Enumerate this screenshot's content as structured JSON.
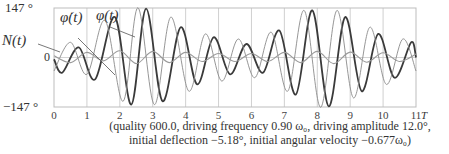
{
  "chart_data": {
    "type": "line",
    "title": "",
    "xlabel": "T",
    "ylabel": "",
    "xlim": [
      0,
      11
    ],
    "ylim": [
      -147,
      147
    ],
    "grid": {
      "vertical": true,
      "horizontal": false
    },
    "x_ticks": [
      "0",
      "1",
      "2",
      "3",
      "4",
      "5",
      "6",
      "7",
      "8",
      "9",
      "10",
      "11"
    ],
    "x_unit_label": "T",
    "y_ticks": [
      "147 °",
      "0",
      "−147 °"
    ],
    "legend": "inline labels",
    "series": [
      {
        "name": "φ(t)",
        "label": "φ(t)",
        "style": "thick dark",
        "color": "#3a3a3a",
        "points": [
          [
            0,
            -5
          ],
          [
            0.25,
            -45
          ],
          [
            0.75,
            30
          ],
          [
            1.25,
            -65
          ],
          [
            1.85,
            120
          ],
          [
            2.35,
            -140
          ],
          [
            2.8,
            145
          ],
          [
            3.3,
            -130
          ],
          [
            3.85,
            90
          ],
          [
            4.35,
            -80
          ],
          [
            4.85,
            60
          ],
          [
            5.35,
            -50
          ],
          [
            5.85,
            40
          ],
          [
            6.35,
            -45
          ],
          [
            6.85,
            80
          ],
          [
            7.35,
            -110
          ],
          [
            7.85,
            140
          ],
          [
            8.35,
            -145
          ],
          [
            8.85,
            120
          ],
          [
            9.35,
            -100
          ],
          [
            9.85,
            70
          ],
          [
            10.35,
            -60
          ],
          [
            10.85,
            45
          ],
          [
            11,
            0
          ]
        ]
      },
      {
        "name": "φ̇(t)",
        "label": "φ̇(t)",
        "style": "thin gray",
        "color": "#8a8a8a",
        "points": [
          [
            0,
            -40
          ],
          [
            0.5,
            45
          ],
          [
            1.0,
            -50
          ],
          [
            1.55,
            110
          ],
          [
            2.1,
            -130
          ],
          [
            2.55,
            148
          ],
          [
            3.05,
            -140
          ],
          [
            3.55,
            120
          ],
          [
            4.1,
            -100
          ],
          [
            4.6,
            70
          ],
          [
            5.1,
            -70
          ],
          [
            5.6,
            55
          ],
          [
            6.1,
            -60
          ],
          [
            6.6,
            75
          ],
          [
            7.1,
            -100
          ],
          [
            7.6,
            140
          ],
          [
            8.1,
            -148
          ],
          [
            8.6,
            140
          ],
          [
            9.1,
            -120
          ],
          [
            9.6,
            90
          ],
          [
            10.1,
            -80
          ],
          [
            10.6,
            55
          ],
          [
            11,
            -40
          ]
        ]
      },
      {
        "name": "N(t)",
        "label": "N(t)",
        "style": "medium gray, small amplitude",
        "color": "#9a9a9a",
        "points": [
          [
            0,
            5
          ],
          [
            0.5,
            -15
          ],
          [
            1.0,
            15
          ],
          [
            1.5,
            -10
          ],
          [
            2.0,
            20
          ],
          [
            2.5,
            -18
          ],
          [
            3.0,
            18
          ],
          [
            3.5,
            -15
          ],
          [
            4.0,
            15
          ],
          [
            4.5,
            -12
          ],
          [
            5.0,
            12
          ],
          [
            5.5,
            -12
          ],
          [
            6.0,
            12
          ],
          [
            6.5,
            -12
          ],
          [
            7.0,
            15
          ],
          [
            7.5,
            -15
          ],
          [
            8.0,
            18
          ],
          [
            8.5,
            -18
          ],
          [
            9.0,
            16
          ],
          [
            9.5,
            -14
          ],
          [
            10.0,
            14
          ],
          [
            10.5,
            -12
          ],
          [
            11,
            10
          ]
        ]
      }
    ],
    "caption": [
      "(quality 600.0, driving frequency 0.90 ω₀, driving amplitude 12.0°,",
      "initial deflection −5.18°, initial angular velocity −0.677ω₀)"
    ]
  },
  "labels": {
    "y_top": "147 °",
    "y_zero": "0",
    "y_bottom": "−147 °",
    "phi_dot": "φ̇(t)",
    "phi": "φ(t)",
    "N": "N(t)",
    "x_unit": "T"
  }
}
